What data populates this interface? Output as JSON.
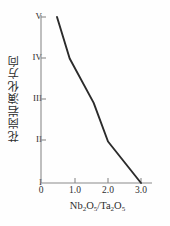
{
  "chart_data": {
    "type": "line",
    "title": "",
    "xlabel": "Nb2O5/Ta2O5",
    "xlabel_parts": [
      {
        "t": "Nb"
      },
      {
        "t": "2",
        "sub": true
      },
      {
        "t": "O"
      },
      {
        "t": "5",
        "sub": true
      },
      {
        "t": "/"
      },
      {
        "t": "Ta"
      },
      {
        "t": "2",
        "sub": true
      },
      {
        "t": "O"
      },
      {
        "t": "5",
        "sub": true
      }
    ],
    "ylabel": "花岗岩演化方向",
    "x": [
      0.48,
      0.86,
      1.58,
      2.01,
      3.0
    ],
    "y": [
      5,
      4,
      2.93,
      2,
      1
    ],
    "xticks": [
      0,
      1.0,
      2.0,
      3.0
    ],
    "xtick_labels": [
      "0",
      "1.0",
      "2.0",
      "3.0"
    ],
    "yticks": [
      1,
      2,
      3,
      4,
      5
    ],
    "ytick_labels": [
      "I",
      "II",
      "III",
      "IV",
      "V"
    ],
    "xlim": [
      0,
      3.25
    ],
    "ylim": [
      1,
      5
    ],
    "grid": false,
    "legend": null,
    "line_color": "#2b2b2b",
    "axis_color": "#8a8a8a",
    "series": [
      {
        "name": "granite evolution trend",
        "points": [
          {
            "x": 0.48,
            "y": 5
          },
          {
            "x": 0.86,
            "y": 4
          },
          {
            "x": 1.58,
            "y": 2.93
          },
          {
            "x": 2.01,
            "y": 2
          },
          {
            "x": 3.0,
            "y": 1
          }
        ]
      }
    ]
  }
}
